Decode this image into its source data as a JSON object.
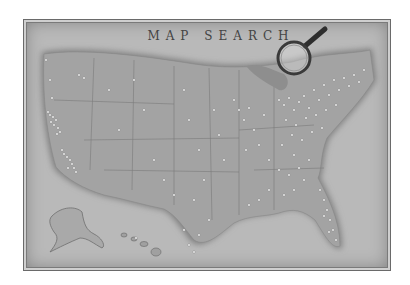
{
  "map": {
    "title": "MAP SEARCH",
    "colors": {
      "background": "#b9b9b9",
      "land": "#a3a3a3",
      "water_shadow": "#7d7d7d",
      "pin": "#f2f2f2",
      "border": "#6a6a6a"
    },
    "top_ruler_ticks": [
      "",
      "",
      "",
      "",
      "",
      "",
      "",
      "",
      "",
      "",
      "",
      "",
      "",
      "",
      ""
    ],
    "regions_shown": [
      "Contiguous United States",
      "Alaska",
      "Hawaii"
    ],
    "pin_density": {
      "west_coast": "high",
      "mountain_west": "low",
      "plains": "low",
      "midwest": "medium",
      "northeast": "very high",
      "southeast": "high",
      "florida": "high",
      "texas": "low"
    },
    "magnifier_icon": "magnifying-glass"
  }
}
